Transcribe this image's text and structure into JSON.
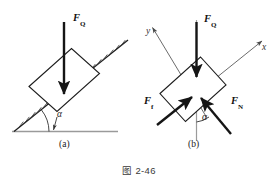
{
  "figure": {
    "caption": "图 2-46",
    "panels": [
      {
        "id": "a",
        "label": "(a)",
        "description": "block resting on hatched inclined plane",
        "angle_label": "α",
        "forces": [
          {
            "name": "F_Q",
            "base": "F",
            "subscript": "Q",
            "direction": "vertical-down"
          }
        ]
      },
      {
        "id": "b",
        "label": "(b)",
        "description": "free body diagram of block with rotated axes",
        "angle_label": "α",
        "axes": [
          {
            "name": "x",
            "label": "x",
            "direction": "up-right along incline"
          },
          {
            "name": "y",
            "label": "y",
            "direction": "up-left normal to incline"
          }
        ],
        "forces": [
          {
            "name": "F_Q",
            "base": "F",
            "subscript": "Q",
            "direction": "vertical-down"
          },
          {
            "name": "F_f",
            "base": "F",
            "subscript": "f",
            "direction": "up-incline"
          },
          {
            "name": "F_N",
            "base": "F",
            "subscript": "N",
            "direction": "normal to incline"
          }
        ]
      }
    ]
  },
  "colors": {
    "ink": "#1a1a1a",
    "thin_line": "#4a4a4a",
    "axis_line": "#555555",
    "vertical_guide": "#8a8a8a",
    "ground": "#9a9a9a",
    "caption": "#3a3a3a"
  }
}
